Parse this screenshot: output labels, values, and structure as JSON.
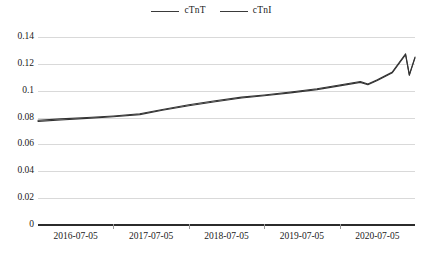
{
  "chart_data": {
    "type": "line",
    "title": "",
    "xlabel": "",
    "ylabel": "",
    "ylim": [
      0,
      0.14
    ],
    "y_ticks": [
      "0",
      "0.02",
      "0.04",
      "0.06",
      "0.08",
      "0.1",
      "0.12",
      "0.14"
    ],
    "y_tick_values": [
      0,
      0.02,
      0.04,
      0.06,
      0.08,
      0.1,
      0.12,
      0.14
    ],
    "grid": true,
    "legend_position": "top-center",
    "categories": [
      "2016-07-05",
      "2017-07-05",
      "2018-07-05",
      "2019-07-05",
      "2020-07-05"
    ],
    "x_tick_labels": [
      "2016-07-05",
      "2017-07-05",
      "2018-07-05",
      "2019-07-05",
      "2020-07-05"
    ],
    "series": [
      {
        "name": "cTnT",
        "color": "#333333",
        "x": [
          0,
          0.06,
          0.13,
          0.2,
          0.27,
          0.33,
          0.4,
          0.47,
          0.54,
          0.6,
          0.67,
          0.74,
          0.8,
          0.855,
          0.875,
          0.9,
          0.94,
          0.975,
          0.985,
          1.0
        ],
        "values": [
          0.078,
          0.079,
          0.08,
          0.0812,
          0.0828,
          0.086,
          0.0895,
          0.0925,
          0.0952,
          0.0968,
          0.099,
          0.1015,
          0.1042,
          0.1068,
          0.105,
          0.1082,
          0.114,
          0.1275,
          0.112,
          0.125
        ]
      },
      {
        "name": "cTnI",
        "color": "#333333",
        "x": [
          0,
          0.06,
          0.13,
          0.2,
          0.27,
          0.33,
          0.4,
          0.47,
          0.54,
          0.6,
          0.67,
          0.74,
          0.8,
          0.855,
          0.875,
          0.9,
          0.94,
          0.975,
          0.985,
          1.0
        ],
        "values": [
          0.0772,
          0.0782,
          0.0794,
          0.0806,
          0.0822,
          0.0854,
          0.0888,
          0.0918,
          0.0946,
          0.0962,
          0.0984,
          0.1008,
          0.1036,
          0.1062,
          0.1044,
          0.1076,
          0.1134,
          0.1268,
          0.1114,
          0.1244
        ]
      }
    ]
  },
  "legend": {
    "entries": [
      {
        "label": "cTnT"
      },
      {
        "label": "cTnI"
      }
    ]
  }
}
